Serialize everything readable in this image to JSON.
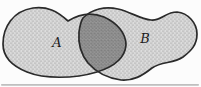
{
  "figure": {
    "type": "venn-diagram",
    "labels": {
      "left_set": "A",
      "right_set": "B"
    },
    "colors": {
      "background": "#fcfcfc",
      "outline": "#2a2a2a",
      "set_fill": "#dedede",
      "stipple_dot": "#6e6e6e",
      "stipple_dot_faint": "#8a8a8a",
      "intersection_fill": "#999999",
      "intersection_dot": "#525252",
      "intersection_dot_faint": "#6b6b6b",
      "label_color": "#1c1c1c",
      "baseline_artifact": "#9e9e9e"
    }
  }
}
